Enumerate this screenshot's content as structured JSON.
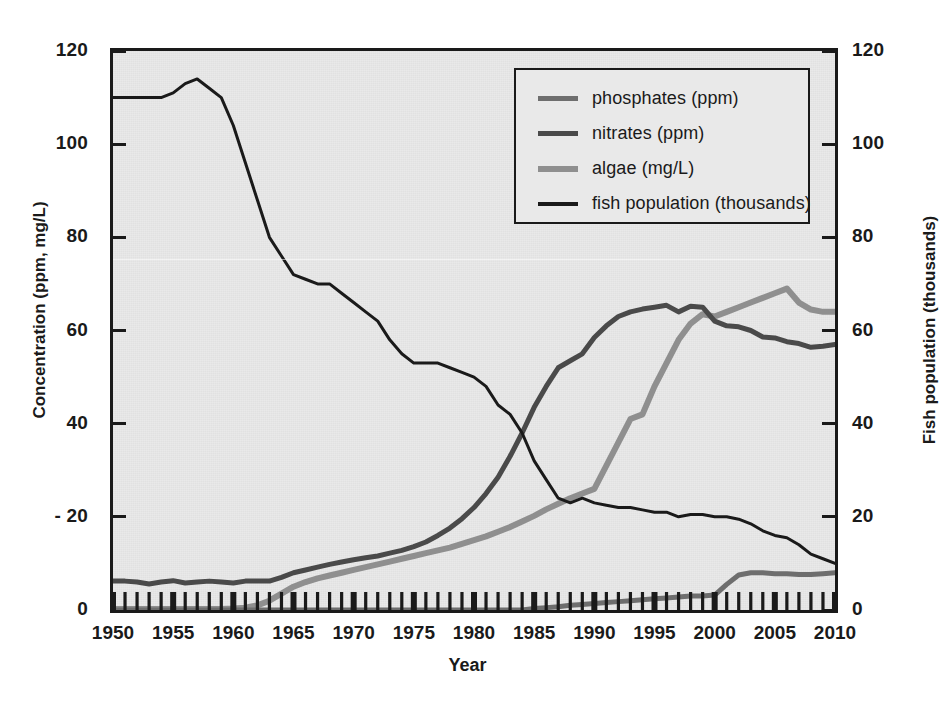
{
  "chart_data": {
    "type": "line",
    "title": "",
    "xlabel": "Year",
    "ylabel": "Concentration (ppm, mg/L)",
    "y2label": "Fish population (thousands)",
    "xlim": [
      1950,
      2010
    ],
    "ylim": [
      0,
      120
    ],
    "y2lim": [
      0,
      120
    ],
    "grid": false,
    "legend_position": "upper-right-inside",
    "x_tick_labels": [
      "1950",
      "1955",
      "1960",
      "1965",
      "1970",
      "1975",
      "1980",
      "1985",
      "1990",
      "1995",
      "2000",
      "2005",
      "2010"
    ],
    "x_tick_values": [
      1950,
      1955,
      1960,
      1965,
      1970,
      1975,
      1980,
      1985,
      1990,
      1995,
      2000,
      2005,
      2010
    ],
    "x_minor_ticks_every": 1,
    "y_tick_labels": [
      "0",
      "20",
      "40",
      "60",
      "80",
      "100",
      "120"
    ],
    "y_tick_values": [
      0,
      20,
      40,
      60,
      80,
      100,
      120
    ],
    "y2_tick_labels": [
      "0",
      "20",
      "40",
      "60",
      "80",
      "100",
      "120"
    ],
    "y2_tick_values": [
      0,
      20,
      40,
      60,
      80,
      100,
      120
    ],
    "y_left_tick_prefix_artifact": "- 20",
    "x": [
      1950,
      1951,
      1952,
      1953,
      1954,
      1955,
      1956,
      1957,
      1958,
      1959,
      1960,
      1961,
      1962,
      1963,
      1964,
      1965,
      1966,
      1967,
      1968,
      1969,
      1970,
      1971,
      1972,
      1973,
      1974,
      1975,
      1976,
      1977,
      1978,
      1979,
      1980,
      1981,
      1982,
      1983,
      1984,
      1985,
      1986,
      1987,
      1988,
      1989,
      1990,
      1991,
      1992,
      1993,
      1994,
      1995,
      1996,
      1997,
      1998,
      1999,
      2000,
      2001,
      2002,
      2003,
      2004,
      2005,
      2006,
      2007,
      2008,
      2009,
      2010
    ],
    "series": [
      {
        "name": "phosphates (ppm)",
        "unit": "ppm",
        "axis": "left",
        "color": "#6e6e6e",
        "width": 5,
        "values": [
          0,
          0,
          0,
          0,
          0,
          0,
          0,
          0,
          0,
          0,
          0,
          0,
          0,
          0,
          0,
          0,
          0,
          0,
          0,
          0,
          0,
          0,
          0,
          0,
          0,
          0,
          0,
          0,
          0,
          0,
          0,
          0,
          0,
          0,
          0,
          0.3,
          0.5,
          0.7,
          1.0,
          1.2,
          1.4,
          1.6,
          1.8,
          2.0,
          2.2,
          2.4,
          2.6,
          2.8,
          3.0,
          3.0,
          3.2,
          5.5,
          7.5,
          8.0,
          8.0,
          7.8,
          7.8,
          7.6,
          7.6,
          7.8,
          8.0
        ]
      },
      {
        "name": "nitrates (ppm)",
        "unit": "ppm",
        "axis": "left",
        "color": "#4a4a4a",
        "width": 5,
        "values": [
          6.2,
          6.2,
          6.0,
          5.6,
          6.0,
          6.3,
          5.8,
          6.0,
          6.2,
          6.0,
          5.8,
          6.2,
          6.2,
          6.2,
          7.0,
          8.0,
          8.6,
          9.2,
          9.8,
          10.3,
          10.8,
          11.2,
          11.6,
          12.2,
          12.8,
          13.6,
          14.6,
          16.0,
          17.6,
          19.6,
          22.0,
          25.0,
          28.5,
          33.0,
          38.0,
          43.5,
          48.0,
          52.0,
          53.5,
          55.0,
          58.5,
          61.0,
          63.0,
          64.0,
          64.6,
          65.0,
          65.4,
          64.0,
          65.2,
          65.0,
          62.0,
          61.0,
          60.8,
          60.0,
          58.6,
          58.4,
          57.6,
          57.2,
          56.4,
          56.6,
          57.0
        ]
      },
      {
        "name": "algae (mg/L)",
        "unit": "mg/L",
        "axis": "left",
        "color": "#8f8f8f",
        "width": 6,
        "values": [
          0.2,
          0.2,
          0.2,
          0.2,
          0.2,
          0.2,
          0.2,
          0.2,
          0.2,
          0.2,
          0.3,
          0.5,
          1.0,
          2.0,
          3.5,
          5.0,
          6.0,
          6.8,
          7.4,
          8.0,
          8.6,
          9.2,
          9.8,
          10.4,
          11.0,
          11.6,
          12.2,
          12.8,
          13.4,
          14.2,
          15.0,
          15.8,
          16.8,
          17.8,
          19.0,
          20.2,
          21.6,
          22.8,
          24.0,
          25.0,
          26.0,
          31.0,
          36.0,
          41.0,
          42.0,
          48.0,
          53.0,
          58.0,
          61.5,
          63.5,
          63.0,
          64.0,
          65.0,
          66.0,
          67.0,
          68.0,
          69.0,
          66.0,
          64.5,
          64.0,
          64.0
        ]
      },
      {
        "name": "fish population (thousands)",
        "unit": "thousands",
        "axis": "right",
        "color": "#1a1a1a",
        "width": 3,
        "values": [
          110,
          110,
          110,
          110,
          110,
          111,
          113,
          114,
          112,
          110,
          104,
          96,
          88,
          80,
          76,
          72,
          71,
          70,
          70,
          68,
          66,
          64,
          62,
          58,
          55,
          53,
          53,
          53,
          52,
          51,
          50,
          48,
          44,
          42,
          38,
          32,
          28,
          24,
          23,
          24,
          23,
          22.5,
          22,
          22,
          21.5,
          21,
          21,
          20,
          20.5,
          20.5,
          20,
          20,
          19.5,
          18.5,
          17,
          16,
          15.5,
          14,
          12,
          11,
          10
        ]
      }
    ]
  },
  "axes": {
    "left_title": "Concentration (ppm, mg/L)",
    "right_title": "Fish population (thousands)",
    "x_title": "Year"
  },
  "legend": {
    "items": [
      {
        "label": "phosphates (ppm)",
        "color": "#6e6e6e"
      },
      {
        "label": "nitrates (ppm)",
        "color": "#4a4a4a"
      },
      {
        "label": "algae (mg/L)",
        "color": "#8f8f8f"
      },
      {
        "label": "fish population (thousands)",
        "color": "#1a1a1a"
      }
    ]
  },
  "colors": {
    "plot_background": "#e9e9e9",
    "page_background": "#ffffff",
    "axis": "#1a1a1a",
    "phosphates": "#6e6e6e",
    "nitrates": "#4a4a4a",
    "algae": "#8f8f8f",
    "fish": "#1a1a1a"
  }
}
